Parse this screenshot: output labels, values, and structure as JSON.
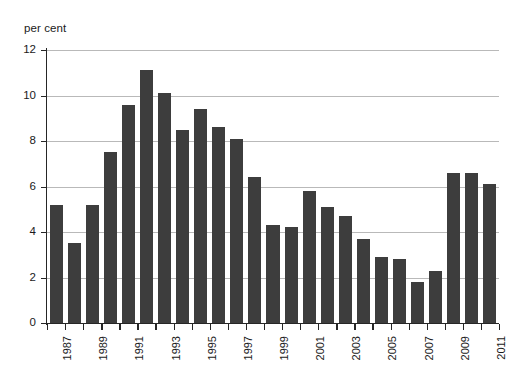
{
  "chart_data": {
    "type": "bar",
    "title": "",
    "subtitle": "",
    "xlabel": "",
    "ylabel": "per cent",
    "ylim": [
      0,
      12
    ],
    "ytick_values": [
      0,
      2,
      4,
      6,
      8,
      10,
      12
    ],
    "ytick_labels": [
      "0",
      "2",
      "4",
      "6",
      "8",
      "10",
      "12"
    ],
    "grid": true,
    "legend": null,
    "bar_color": "#3d3d3d",
    "axis_color": "#262626",
    "gridline_color": "#b9b9b9",
    "categories": [
      "1987",
      "1988",
      "1989",
      "1990",
      "1991",
      "1992",
      "1993",
      "1994",
      "1995",
      "1996",
      "1997",
      "1998",
      "1999",
      "2000",
      "2001",
      "2002",
      "2003",
      "2004",
      "2005",
      "2006",
      "2007",
      "2008",
      "2009",
      "2010",
      "2011"
    ],
    "xtick_labels": [
      "1987",
      "1989",
      "1991",
      "1993",
      "1995",
      "1997",
      "1999",
      "2001",
      "2003",
      "2005",
      "2007",
      "2009",
      "2011"
    ],
    "values": [
      5.2,
      3.5,
      5.2,
      7.5,
      11.1,
      10.1,
      8.5,
      9.4,
      8.6,
      8.1,
      6.4,
      4.3,
      4.2,
      5.8,
      5.1,
      4.7,
      3.7,
      2.9,
      2.7,
      1.8,
      2.3,
      6.6,
      6.6,
      6.1,
      0
    ],
    "series": [
      {
        "name": "per cent",
        "values": [
          5.2,
          3.5,
          5.2,
          7.5,
          11.1,
          10.1,
          8.5,
          9.4,
          8.6,
          8.1,
          6.4,
          4.3,
          4.2,
          5.8,
          5.1,
          4.7,
          3.7,
          2.9,
          2.7,
          1.8,
          2.3,
          6.6,
          6.6,
          6.1,
          0
        ]
      }
    ],
    "bars": [
      {
        "category": "1987",
        "value": 5.2
      },
      {
        "category": "1988",
        "value": 3.5
      },
      {
        "category": "1989",
        "value": 5.2
      },
      {
        "category": "1990",
        "value": 7.5
      },
      {
        "category": "1991",
        "value": 9.6
      },
      {
        "category": "1992",
        "value": 11.1
      },
      {
        "category": "1993",
        "value": 10.1
      },
      {
        "category": "1994",
        "value": 8.5
      },
      {
        "category": "1995",
        "value": 9.4
      },
      {
        "category": "1996",
        "value": 8.6
      },
      {
        "category": "1997",
        "value": 8.1
      },
      {
        "category": "1998",
        "value": 6.4
      },
      {
        "category": "1999",
        "value": 4.3
      },
      {
        "category": "2000",
        "value": 4.2
      },
      {
        "category": "2001",
        "value": 5.8
      },
      {
        "category": "2002",
        "value": 5.1
      },
      {
        "category": "2003",
        "value": 4.7
      },
      {
        "category": "2004",
        "value": 3.7
      },
      {
        "category": "2005",
        "value": 2.9
      },
      {
        "category": "2006",
        "value": 2.8
      },
      {
        "category": "2007",
        "value": 1.8
      },
      {
        "category": "2008",
        "value": 2.3
      },
      {
        "category": "2009",
        "value": 6.6
      },
      {
        "category": "2010",
        "value": 6.6
      },
      {
        "category": "2011",
        "value": 6.1
      }
    ]
  }
}
